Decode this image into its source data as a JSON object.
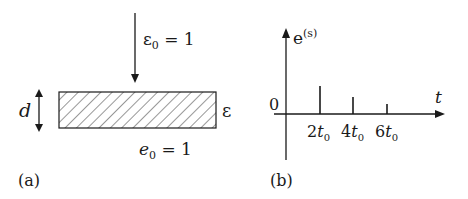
{
  "panel_a": {
    "label": "(a)",
    "incident_label_main": "ε",
    "incident_label_sub": "0",
    "incident_label_rest": " = 1",
    "thickness_label": "d",
    "slab_label": "ε",
    "bottom_label_main": "e",
    "bottom_label_sub": "0",
    "bottom_label_rest": " = 1"
  },
  "panel_b": {
    "label": "(b)",
    "y_axis_label_main": "e",
    "y_axis_label_sup": "(s)",
    "x_axis_label": "t",
    "origin_label": "0",
    "ticks": [
      {
        "num": "2",
        "var": "t",
        "sub": "0"
      },
      {
        "num": "4",
        "var": "t",
        "sub": "0"
      },
      {
        "num": "6",
        "var": "t",
        "sub": "0"
      }
    ]
  },
  "colors": {
    "stroke": "#1a1a1a",
    "background": "#ffffff"
  }
}
